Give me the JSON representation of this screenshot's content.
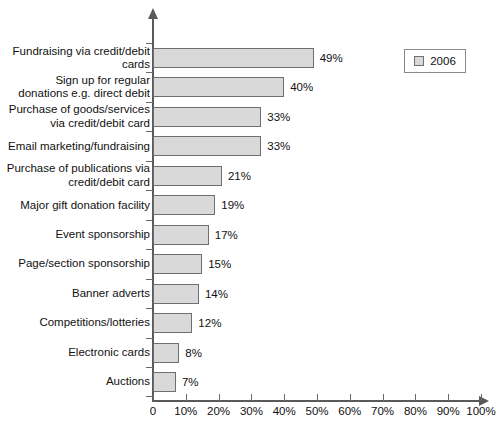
{
  "chart_data": {
    "type": "bar",
    "orientation": "horizontal",
    "title": "",
    "subtitle": "",
    "xlabel": "",
    "ylabel": "",
    "xlim": [
      0,
      100
    ],
    "grid": false,
    "legend_position": "top-right",
    "legend": [
      "2006"
    ],
    "xticks": [
      0,
      10,
      20,
      30,
      40,
      50,
      60,
      70,
      80,
      90,
      100
    ],
    "xtick_labels": [
      "0",
      "10%",
      "20%",
      "30%",
      "40%",
      "50%",
      "60%",
      "70%",
      "80%",
      "90%",
      "100%"
    ],
    "categories": [
      "Fundraising via credit/debit\ncards",
      "Sign up for regular\ndonations e.g. direct debit",
      "Purchase of goods/services\nvia credit/debit card",
      "Email marketing/fundraising",
      "Purchase of publications via\ncredit/debit card",
      "Major gift donation facility",
      "Event sponsorship",
      "Page/section sponsorship",
      "Banner adverts",
      "Competitions/lotteries",
      "Electronic cards",
      "Auctions"
    ],
    "series": [
      {
        "name": "2006",
        "values": [
          49,
          40,
          33,
          33,
          21,
          19,
          17,
          15,
          14,
          12,
          8,
          7
        ],
        "data_labels": [
          "49%",
          "40%",
          "33%",
          "33%",
          "21%",
          "19%",
          "17%",
          "15%",
          "14%",
          "12%",
          "8%",
          "7%"
        ],
        "color": "#d9d9d9",
        "border_color": "#6e6e6e"
      }
    ]
  },
  "legend": {
    "items": [
      {
        "label": "2006",
        "swatch_color": "#d9d9d9"
      }
    ]
  }
}
